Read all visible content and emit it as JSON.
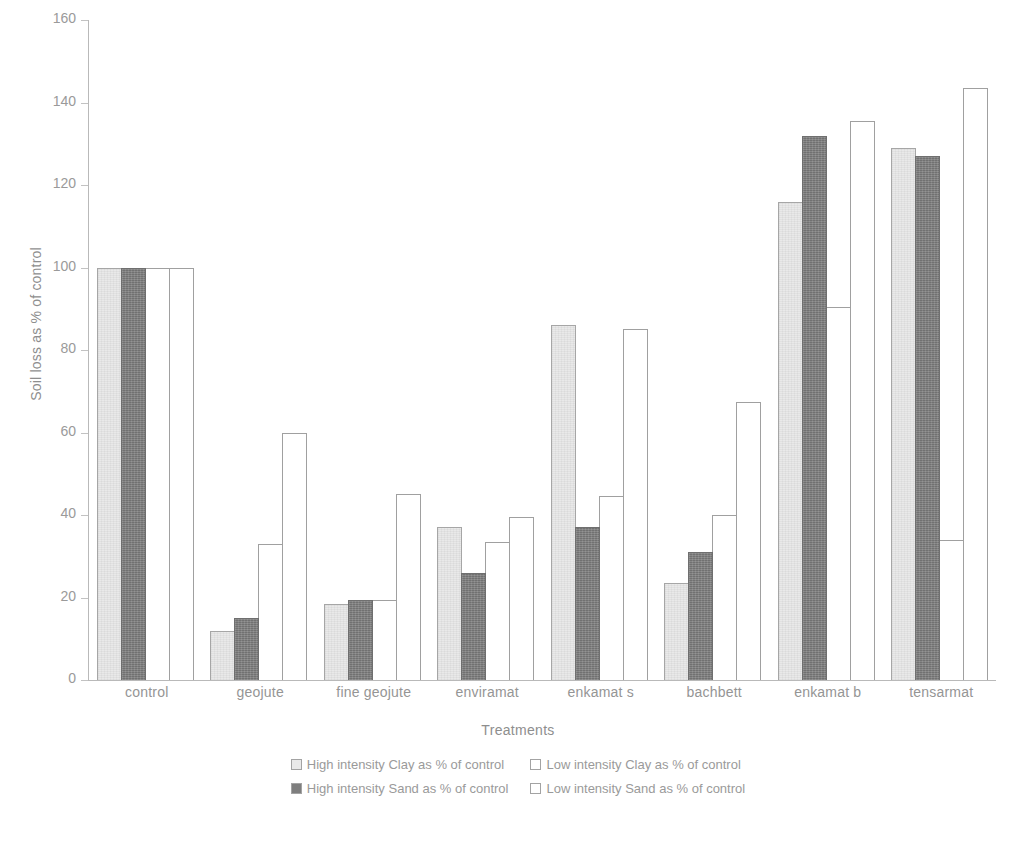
{
  "chart_data": {
    "type": "bar",
    "title": "",
    "xlabel": "Treatments",
    "ylabel": "Soil loss as % of control",
    "ylim": [
      0,
      160
    ],
    "yticks": [
      0,
      20,
      40,
      60,
      80,
      100,
      120,
      140,
      160
    ],
    "grid": false,
    "legend_position": "bottom",
    "categories": [
      "control",
      "geojute",
      "fine geojute",
      "enviramat",
      "enkamat s",
      "bachbett",
      "enkamat b",
      "tensarmat"
    ],
    "series": [
      {
        "name": "High intensity Clay as % of control",
        "color": "#e9e9e9",
        "values": [
          100,
          12,
          18.5,
          37,
          86,
          23.5,
          116,
          129
        ]
      },
      {
        "name": "High intensity Sand as % of control",
        "color": "#7e7e7e",
        "values": [
          100,
          15,
          19.5,
          26,
          37,
          31,
          132,
          127
        ]
      },
      {
        "name": "Low intensity Clay as % of control",
        "color": "#ffffff",
        "values": [
          100,
          33,
          19.5,
          33.5,
          44.5,
          40,
          90.5,
          34
        ]
      },
      {
        "name": "Low intensity Sand as % of control",
        "color": "#ffffff",
        "values": [
          100,
          60,
          45,
          39.5,
          85,
          67.5,
          135.5,
          143.5
        ]
      }
    ]
  },
  "axes": {
    "y_title": "Soil loss as % of control",
    "x_title": "Treatments",
    "y_tick_labels": [
      "0",
      "20",
      "40",
      "60",
      "80",
      "100",
      "120",
      "140",
      "160"
    ],
    "x_tick_labels": [
      "control",
      "geojute",
      "fine geojute",
      "enviramat",
      "enkamat s",
      "bachbett",
      "enkamat b",
      "tensarmat"
    ]
  },
  "legend": {
    "entries": [
      {
        "label": "High intensity Clay as % of control",
        "swatch": "light-gray-swatch"
      },
      {
        "label": "Low intensity Clay as % of control",
        "swatch": "white-swatch"
      },
      {
        "label": "High intensity Sand as % of control",
        "swatch": "dark-gray-swatch"
      },
      {
        "label": "Low intensity Sand as % of control",
        "swatch": "white-swatch"
      }
    ]
  }
}
